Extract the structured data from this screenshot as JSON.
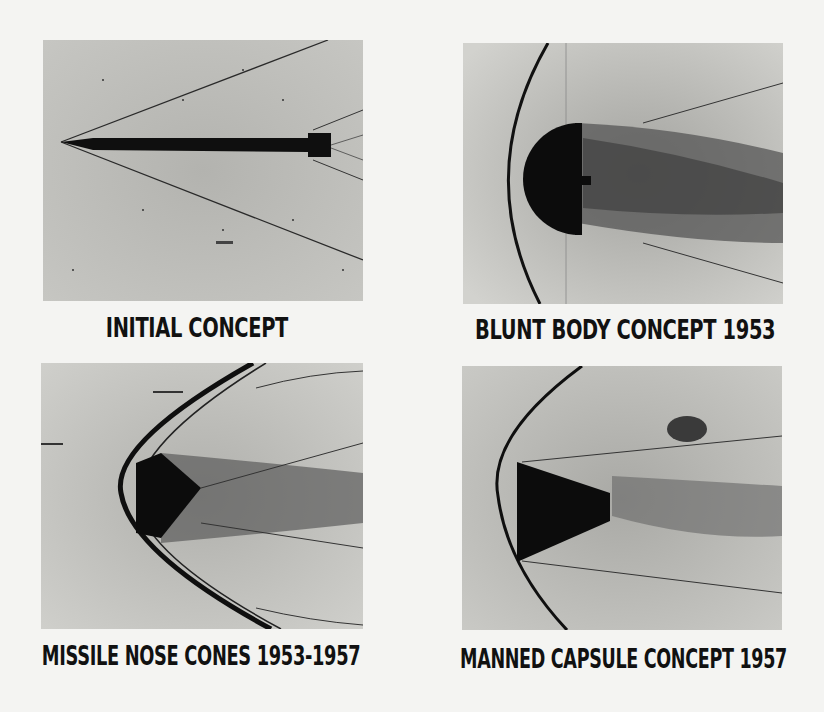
{
  "figure": {
    "panels": [
      {
        "id": "initial-concept",
        "caption": "INITIAL CONCEPT",
        "subject": "slender pointed body with sharp conical shock wave"
      },
      {
        "id": "blunt-body-concept",
        "caption": "BLUNT BODY CONCEPT 1953",
        "subject": "hemispherical blunt body with detached bow shock"
      },
      {
        "id": "missile-nose-cones",
        "caption": "MISSILE NOSE CONES 1953-1957",
        "subject": "blunted cone nose with strong bow shock"
      },
      {
        "id": "manned-capsule-concept",
        "caption": "MANNED CAPSULE CONCEPT 1957",
        "subject": "truncated cone capsule, blunt face forward, with bow shock"
      }
    ]
  },
  "colors": {
    "page": "#f4f4f2",
    "photo_bg": "#b9b9b5",
    "body": "#0c0c0c",
    "text": "#111111"
  }
}
